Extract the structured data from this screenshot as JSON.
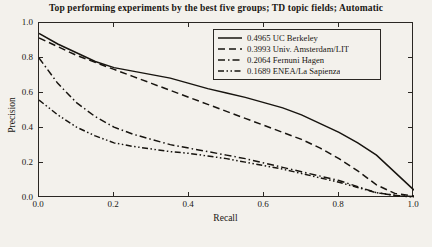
{
  "chart_data": {
    "type": "line",
    "title": "Top performing experiments by the best five groups; TD topic fields; Automatic",
    "xlabel": "Recall",
    "ylabel": "Precision",
    "xlim": [
      0.0,
      1.0
    ],
    "ylim": [
      0.0,
      1.0
    ],
    "xticks": [
      "0.0",
      "0.2",
      "0.4",
      "0.6",
      "0.8",
      "1.0"
    ],
    "xtick_values": [
      0.0,
      0.2,
      0.4,
      0.6,
      0.8,
      1.0
    ],
    "yticks": [
      "0.0",
      "0.2",
      "0.4",
      "0.6",
      "0.8",
      "1.0"
    ],
    "ytick_values": [
      0.0,
      0.2,
      0.4,
      0.6,
      0.8,
      1.0
    ],
    "grid": false,
    "legend_position": "upper right",
    "x": [
      0.0,
      0.05,
      0.1,
      0.15,
      0.2,
      0.25,
      0.3,
      0.35,
      0.4,
      0.45,
      0.5,
      0.55,
      0.6,
      0.65,
      0.7,
      0.75,
      0.8,
      0.85,
      0.9,
      0.95,
      1.0
    ],
    "series": [
      {
        "name": "0.4965 UC Berkeley",
        "score": 0.4965,
        "group": "UC Berkeley",
        "style": "solid",
        "values": [
          0.94,
          0.88,
          0.83,
          0.78,
          0.745,
          0.725,
          0.705,
          0.685,
          0.655,
          0.625,
          0.6,
          0.575,
          0.545,
          0.515,
          0.475,
          0.425,
          0.375,
          0.315,
          0.245,
          0.145,
          0.045
        ]
      },
      {
        "name": "0.3993 Univ. Amsterdam/LIT",
        "score": 0.3993,
        "group": "Univ. Amsterdam/LIT",
        "style": "dashed",
        "values": [
          0.915,
          0.865,
          0.815,
          0.775,
          0.735,
          0.695,
          0.655,
          0.615,
          0.575,
          0.535,
          0.495,
          0.455,
          0.415,
          0.375,
          0.335,
          0.285,
          0.225,
          0.155,
          0.075,
          0.025,
          0.012
        ]
      },
      {
        "name": "0.2064 Fernuni Hagen",
        "score": 0.2064,
        "group": "Fernuni Hagen",
        "style": "dashdot",
        "values": [
          0.8,
          0.655,
          0.545,
          0.465,
          0.405,
          0.365,
          0.335,
          0.305,
          0.285,
          0.265,
          0.245,
          0.225,
          0.2,
          0.175,
          0.15,
          0.125,
          0.1,
          0.065,
          0.03,
          0.015,
          0.008
        ]
      },
      {
        "name": "0.1689 ENEA/La Sapienza",
        "score": 0.1689,
        "group": "ENEA/La Sapienza",
        "style": "dashdotdot",
        "values": [
          0.56,
          0.475,
          0.405,
          0.355,
          0.315,
          0.295,
          0.28,
          0.265,
          0.255,
          0.24,
          0.225,
          0.205,
          0.185,
          0.165,
          0.14,
          0.115,
          0.09,
          0.06,
          0.03,
          0.015,
          0.005
        ]
      }
    ]
  }
}
